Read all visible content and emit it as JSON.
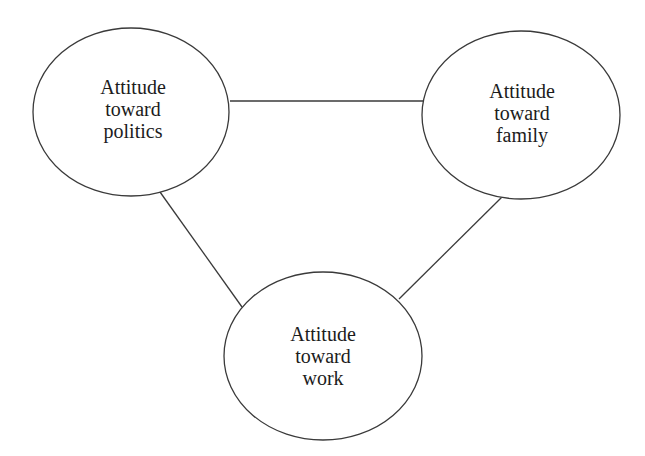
{
  "diagram": {
    "type": "undirected-triangle-network",
    "colors": {
      "stroke": "#3a3a3a",
      "text": "#1c1c1c",
      "background": "#ffffff"
    },
    "nodes": [
      {
        "id": "politics",
        "lines": [
          "Attitude",
          "toward",
          "politics"
        ],
        "label": "Attitude toward politics",
        "cx": 131,
        "cy": 112,
        "rx": 98,
        "ry": 84
      },
      {
        "id": "family",
        "lines": [
          "Attitude",
          "toward",
          "family"
        ],
        "label": "Attitude toward family",
        "cx": 521,
        "cy": 115,
        "rx": 99,
        "ry": 84
      },
      {
        "id": "work",
        "lines": [
          "Attitude",
          "toward",
          "work"
        ],
        "label": "Attitude toward work",
        "cx": 323,
        "cy": 356,
        "rx": 99,
        "ry": 84
      }
    ],
    "edges": [
      {
        "from": "politics",
        "to": "family",
        "x1": 230,
        "y1": 101,
        "x2": 423,
        "y2": 101
      },
      {
        "from": "politics",
        "to": "work",
        "x1": 160,
        "y1": 192,
        "x2": 242,
        "y2": 307
      },
      {
        "from": "family",
        "to": "work",
        "x1": 502,
        "y1": 197,
        "x2": 399,
        "y2": 299
      }
    ]
  }
}
